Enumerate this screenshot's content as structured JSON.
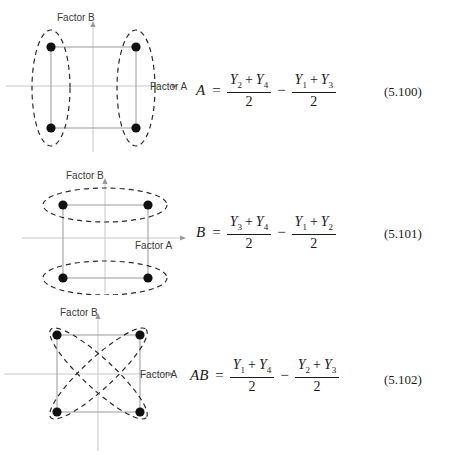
{
  "document": {
    "type": "textbook-figure",
    "description": "Three factorial-design effect diagrams with their contrast formulas"
  },
  "blocks": [
    {
      "id": "effect-a",
      "diagram": {
        "name": "factor-a-main-effect-diagram",
        "x_axis_label": "Factor A",
        "y_axis_label": "Factor B",
        "grouping": "vertical-ellipses",
        "points": [
          {
            "name": "top-left-point",
            "cx": 51,
            "cy": 47
          },
          {
            "name": "top-right-point",
            "cx": 136,
            "cy": 47
          },
          {
            "name": "bottom-left-point",
            "cx": 51,
            "cy": 128
          },
          {
            "name": "bottom-right-point",
            "cx": 136,
            "cy": 128
          }
        ]
      },
      "equation": {
        "lhs": "A",
        "relation": "=",
        "operator": "−",
        "term1": {
          "numerator": [
            "Y2",
            "Y4"
          ],
          "denominator": "2"
        },
        "term2": {
          "numerator": [
            "Y1",
            "Y3"
          ],
          "denominator": "2"
        },
        "number": "(5.100)"
      }
    },
    {
      "id": "effect-b",
      "diagram": {
        "name": "factor-b-main-effect-diagram",
        "x_axis_label": "Factor A",
        "y_axis_label": "Factor B",
        "grouping": "horizontal-ellipses",
        "points": [
          {
            "name": "top-left-point",
            "cx": 63,
            "cy": 50
          },
          {
            "name": "top-right-point",
            "cx": 148,
            "cy": 50
          },
          {
            "name": "bottom-left-point",
            "cx": 63,
            "cy": 123
          },
          {
            "name": "bottom-right-point",
            "cx": 148,
            "cy": 123
          }
        ]
      },
      "equation": {
        "lhs": "B",
        "relation": "=",
        "operator": "−",
        "term1": {
          "numerator": [
            "Y3",
            "Y4"
          ],
          "denominator": "2"
        },
        "term2": {
          "numerator": [
            "Y1",
            "Y2"
          ],
          "denominator": "2"
        },
        "number": "(5.101)"
      }
    },
    {
      "id": "effect-ab",
      "diagram": {
        "name": "factor-ab-interaction-diagram",
        "x_axis_label": "Factor A",
        "y_axis_label": "Factor B",
        "grouping": "diagonal-crossing-ellipses",
        "points": [
          {
            "name": "top-left-point",
            "cx": 57,
            "cy": 40
          },
          {
            "name": "top-right-point",
            "cx": 140,
            "cy": 40
          },
          {
            "name": "bottom-left-point",
            "cx": 57,
            "cy": 117
          },
          {
            "name": "bottom-right-point",
            "cx": 140,
            "cy": 117
          }
        ]
      },
      "equation": {
        "lhs": "AB",
        "relation": "=",
        "operator": "−",
        "term1": {
          "numerator": [
            "Y1",
            "Y4"
          ],
          "denominator": "2"
        },
        "term2": {
          "numerator": [
            "Y2",
            "Y3"
          ],
          "denominator": "2"
        },
        "number": "(5.102)"
      }
    }
  ],
  "symbols": {
    "Y1": {
      "base": "Y",
      "sub": "1"
    },
    "Y2": {
      "base": "Y",
      "sub": "2"
    },
    "Y3": {
      "base": "Y",
      "sub": "3"
    },
    "Y4": {
      "base": "Y",
      "sub": "4"
    },
    "plus": "+",
    "minus": "−",
    "equals": "="
  },
  "colors": {
    "ink": "#1a1a1a",
    "axis": "#c8c8c8",
    "square_edge": "#9a9a9a",
    "dashed_group": "#2b2b2b",
    "point_fill": "#111111",
    "label_text": "#3a3a3a"
  }
}
